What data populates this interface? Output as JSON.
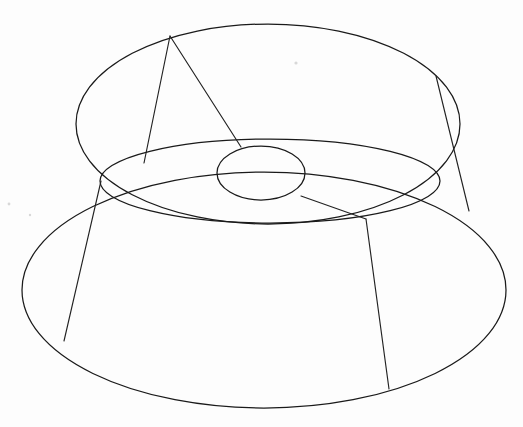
{
  "figure": {
    "background_color": "#fdfdfd",
    "stroke_color": "#1a1a1a",
    "stroke_width": 1.25,
    "canvas": {
      "width": 523,
      "height": 427
    }
  },
  "geometry": {
    "top_rim_ellipse": {
      "name": "top-rim-ellipse",
      "cx": 268,
      "cy": 124,
      "rx": 192,
      "ry": 100,
      "description": "upper outer rim of the flared top"
    },
    "shoulder_ellipse": {
      "name": "shoulder-ellipse",
      "cx": 270,
      "cy": 181,
      "rx": 170,
      "ry": 42,
      "description": "inner/middle ellipse forming the top face waist"
    },
    "bore_ellipse": {
      "name": "bore-ellipse",
      "cx": 261,
      "cy": 173,
      "rx": 44,
      "ry": 27,
      "description": "small central circular hole (bore) in the top face"
    },
    "base_ellipse": {
      "name": "base-ellipse",
      "cx": 264,
      "cy": 290,
      "rx": 242,
      "ry": 118,
      "description": "large lower base rim of the frustum"
    }
  },
  "construction_lines": [
    {
      "name": "apex-left-generatrix",
      "from": [
        170,
        36
      ],
      "to": [
        144,
        163
      ],
      "description": "left leg of the V wedge from top rim down to shoulder ellipse"
    },
    {
      "name": "apex-right-generatrix",
      "from": [
        170,
        36
      ],
      "to": [
        241,
        147
      ],
      "description": "right leg of the V wedge from top rim down to bore top"
    },
    {
      "name": "right-rim-generatrix",
      "from": [
        436,
        76
      ],
      "to": [
        469,
        211
      ],
      "description": "straight edge crossing the top rim arc on the right side"
    },
    {
      "name": "bore-to-base-generatrix",
      "from": [
        301,
        196
      ],
      "to": [
        366,
        219
      ],
      "description": "line from bore lower-right to the shoulder/base junction"
    },
    {
      "name": "right-base-generatrix",
      "from": [
        366,
        219
      ],
      "to": [
        389,
        389
      ],
      "description": "near-vertical slant edge down the outer cone face on the right"
    },
    {
      "name": "left-base-generatrix",
      "from": [
        101,
        181
      ],
      "to": [
        64,
        341
      ],
      "description": "slant edge down the outer cone face on the left"
    }
  ],
  "annotations": {
    "labels": [],
    "dimensions": [],
    "note": "No text, axis ticks, legend, or numeric labels are present in this drawing."
  },
  "artifacts": [
    {
      "name": "paper-speck-top-right",
      "cx": 296,
      "cy": 63,
      "r": 1.6
    },
    {
      "name": "paper-speck-left-edge",
      "cx": 9,
      "cy": 204,
      "r": 1.4
    },
    {
      "name": "paper-speck-mid-left",
      "cx": 30,
      "cy": 215,
      "r": 1.2
    }
  ]
}
